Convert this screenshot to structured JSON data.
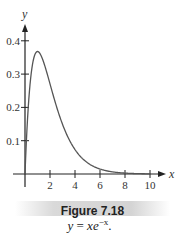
{
  "chart_data": {
    "type": "line",
    "title": "",
    "xlabel": "x",
    "ylabel": "y",
    "xlim": [
      -1,
      11
    ],
    "ylim": [
      0,
      0.45
    ],
    "x_ticks": [
      2,
      4,
      6,
      8,
      10
    ],
    "x_tick_labels": [
      "2",
      "4",
      "6",
      "8",
      "10"
    ],
    "y_ticks": [
      0.1,
      0.2,
      0.3,
      0.4
    ],
    "y_tick_labels": [
      "0.1",
      "0.2",
      "0.3",
      "0.4"
    ],
    "grid": false,
    "legend": "none",
    "series": [
      {
        "name": "y = x e^{-x}",
        "function": "x*exp(-x)",
        "x": [
          0,
          0.25,
          0.5,
          0.75,
          1,
          1.5,
          2,
          2.5,
          3,
          4,
          5,
          6,
          7,
          8,
          9,
          10
        ],
        "y": [
          0,
          0.195,
          0.303,
          0.354,
          0.368,
          0.335,
          0.271,
          0.205,
          0.149,
          0.073,
          0.034,
          0.015,
          0.006,
          0.003,
          0.001,
          0.0005
        ],
        "color": "#555555"
      }
    ]
  },
  "caption": {
    "figure_label": "Figure 7.18",
    "formula_lhs": "y",
    "formula_eq": " = ",
    "formula_x": "x",
    "formula_e": "e",
    "formula_exp": "−x",
    "formula_tail": "."
  }
}
